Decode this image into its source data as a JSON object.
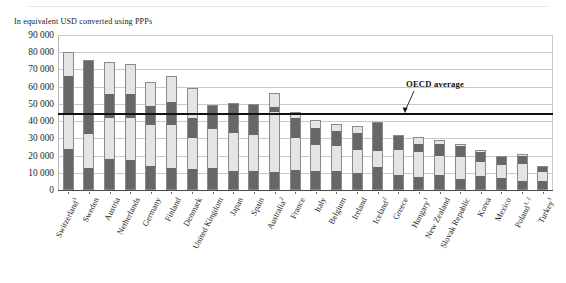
{
  "figure": {
    "subtitle": "In equivalent USD converted using PPPs",
    "annotation_label": "OECD average",
    "annotation_value": 45000
  },
  "colors": {
    "segment_dark": "#676767",
    "segment_light": "#e4e4e4",
    "gridline": "#c9c9cd",
    "average_line": "#131313",
    "text": "#1d1d1d"
  },
  "chart_data": {
    "type": "bar",
    "stacked": true,
    "title": "",
    "subtitle": "In equivalent USD converted using PPPs",
    "xlabel": "",
    "ylabel": "",
    "ylim": [
      0,
      90000
    ],
    "ytick_step": 10000,
    "yticks": [
      "90 000",
      "80 000",
      "70 000",
      "60 000",
      "50 000",
      "40 000",
      "30 000",
      "20 000",
      "10 000",
      "0"
    ],
    "ytick_values": [
      90000,
      80000,
      70000,
      60000,
      50000,
      40000,
      30000,
      20000,
      10000,
      0
    ],
    "grid": true,
    "legend": "none",
    "categories": [
      "Switzerland¹",
      "Sweden",
      "Austria",
      "Netherlands",
      "Germany",
      "Finland",
      "Denmark",
      "United Kingdom",
      "Japan",
      "Spain",
      "Australia²",
      "France",
      "Italy",
      "Belgium",
      "Ireland",
      "Iceland²",
      "Greece",
      "Hungary¹",
      "New Zealand",
      "Slovak Republic",
      "Korea",
      "Mexico",
      "Poland¹·²",
      "Turkey¹"
    ],
    "category_footnotes": {
      "Switzerland¹": "1",
      "Australia²": "2",
      "Iceland²": "2",
      "Hungary¹": "1",
      "Poland¹·²": "1, 2",
      "Turkey¹": "1"
    },
    "series": [
      {
        "name": "Segment 1 (bottom)",
        "shade": "dark",
        "values": [
          24000,
          13000,
          18000,
          17500,
          14000,
          12500,
          12000,
          12500,
          11000,
          11000,
          10500,
          11500,
          11000,
          11000,
          10000,
          13500,
          8500,
          7500,
          8500,
          6500,
          8000,
          7000,
          5500,
          5500
        ]
      },
      {
        "name": "Segment 2",
        "shade": "light",
        "values": [
          21000,
          19500,
          24000,
          24500,
          23500,
          25000,
          18000,
          23000,
          22000,
          21000,
          35000,
          18500,
          15000,
          14500,
          13500,
          9000,
          14500,
          14500,
          11500,
          12500,
          8500,
          7500,
          9500,
          5000
        ]
      },
      {
        "name": "Segment 3",
        "shade": "dark",
        "values": [
          21000,
          43000,
          14000,
          14000,
          11500,
          13500,
          12000,
          14000,
          17500,
          18000,
          2500,
          12000,
          10000,
          9000,
          9500,
          17000,
          9000,
          5000,
          7000,
          6500,
          5500,
          4500,
          5000,
          3500
        ]
      },
      {
        "name": "Segment 4 (top)",
        "shade": "light",
        "values": [
          14000,
          0,
          18500,
          17000,
          14000,
          15000,
          17500,
          0,
          0,
          0,
          8500,
          3500,
          4500,
          4000,
          4000,
          0,
          0,
          4000,
          2000,
          1500,
          1500,
          1000,
          1000,
          0
        ]
      }
    ],
    "totals": [
      80000,
      75500,
      74500,
      73000,
      63000,
      66000,
      59500,
      49500,
      50500,
      50000,
      56500,
      45500,
      40500,
      38500,
      37000,
      39500,
      32000,
      31000,
      29000,
      27000,
      23500,
      20000,
      21000,
      14000
    ],
    "annotations": [
      {
        "label": "OECD average",
        "type": "hline",
        "value": 45000
      }
    ]
  }
}
